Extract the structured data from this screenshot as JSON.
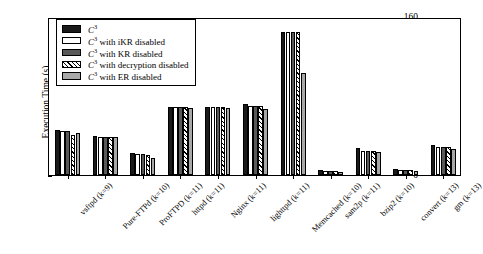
{
  "chart_data": {
    "type": "bar",
    "title": "",
    "xlabel": "",
    "ylabel": "Execution Time (s)",
    "ylim": [
      0,
      160
    ],
    "yticks": [
      0,
      20,
      40,
      60,
      80,
      100,
      120,
      140,
      160
    ],
    "grid": false,
    "legend_position": "upper-left-inside",
    "categories": [
      "vsftpd (k=9)",
      "Pure-FTPd (k=10)",
      "ProFTPD (k=11)",
      "httpd (k=11)",
      "Nginx (k=11)",
      "lighttpd (k=11)",
      "Memcached (k=10)",
      "sam2p (k=11)",
      "bzip2 (k=10)",
      "convert (k=13)",
      "gm (k=13)"
    ],
    "series": [
      {
        "name": "C3",
        "label_html": "C<sup>3</sup>",
        "pattern": "solid-black",
        "color": "#1a1a1a",
        "values": [
          46,
          40,
          22,
          69,
          69,
          72,
          145,
          5,
          27,
          6,
          30
        ]
      },
      {
        "name": "C3 with iKR disabled",
        "label_html": "C<sup>3</sup> with iKR disabled",
        "pattern": "solid-white",
        "color": "#ffffff",
        "values": [
          45,
          39,
          21,
          69,
          69,
          70,
          145,
          4,
          24,
          5,
          28
        ]
      },
      {
        "name": "C3 with KR disabled",
        "label_html": "C<sup>3</sup> with KR disabled",
        "pattern": "solid-darkgray",
        "color": "#595959",
        "values": [
          45,
          39,
          21,
          69,
          69,
          70,
          145,
          4,
          24,
          5,
          28
        ]
      },
      {
        "name": "C3 with decryption disabled",
        "label_html": "C<sup>3</sup> with decryption disabled",
        "pattern": "diagonal-hatch",
        "color": "#ffffff",
        "values": [
          41,
          39,
          20,
          69,
          69,
          70,
          145,
          4,
          24,
          5,
          28
        ]
      },
      {
        "name": "C3 with ER disabled",
        "label_html": "C<sup>3</sup> with ER disabled",
        "pattern": "solid-lightgray",
        "color": "#a8a8a8",
        "values": [
          43,
          38,
          17,
          68,
          68,
          67,
          103,
          3,
          23,
          4,
          26
        ]
      }
    ]
  },
  "legend": {
    "items": [
      "C3",
      "C3 with iKR disabled",
      "C3 with KR disabled",
      "C3 with decryption disabled",
      "C3 with ER disabled"
    ]
  }
}
